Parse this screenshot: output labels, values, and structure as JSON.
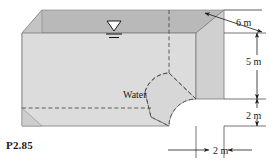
{
  "figure": {
    "id_label": "P2.85",
    "type": "engineering-diagram",
    "fluid_label": "Water",
    "surface_symbol": "free-surface-triangle",
    "colors": {
      "top_face": "#b9b9b9",
      "front_face": "#d9d9d9",
      "right_face": "#cccccc",
      "gate_face": "#d2d2d2",
      "outline": "#4d4d4d",
      "dashed": "#4d4d4d",
      "text": "#1a1a1a",
      "background": "#ffffff"
    },
    "dimensions": [
      {
        "name": "depth",
        "label": "6 m",
        "value": 6,
        "unit": "m",
        "orientation": "oblique"
      },
      {
        "name": "water-height",
        "label": "5 m",
        "value": 5,
        "unit": "m",
        "orientation": "vertical"
      },
      {
        "name": "gate-height",
        "label": "2 m",
        "value": 2,
        "unit": "m",
        "orientation": "vertical"
      },
      {
        "name": "gate-width",
        "label": "2 m",
        "value": 2,
        "unit": "m",
        "orientation": "horizontal"
      }
    ]
  },
  "labels": {
    "six_m": "6 m",
    "five_m": "5 m",
    "two_m_vertical": "2 m",
    "two_m_horizontal": "2 m",
    "water": "Water",
    "problem": "P2.85"
  }
}
